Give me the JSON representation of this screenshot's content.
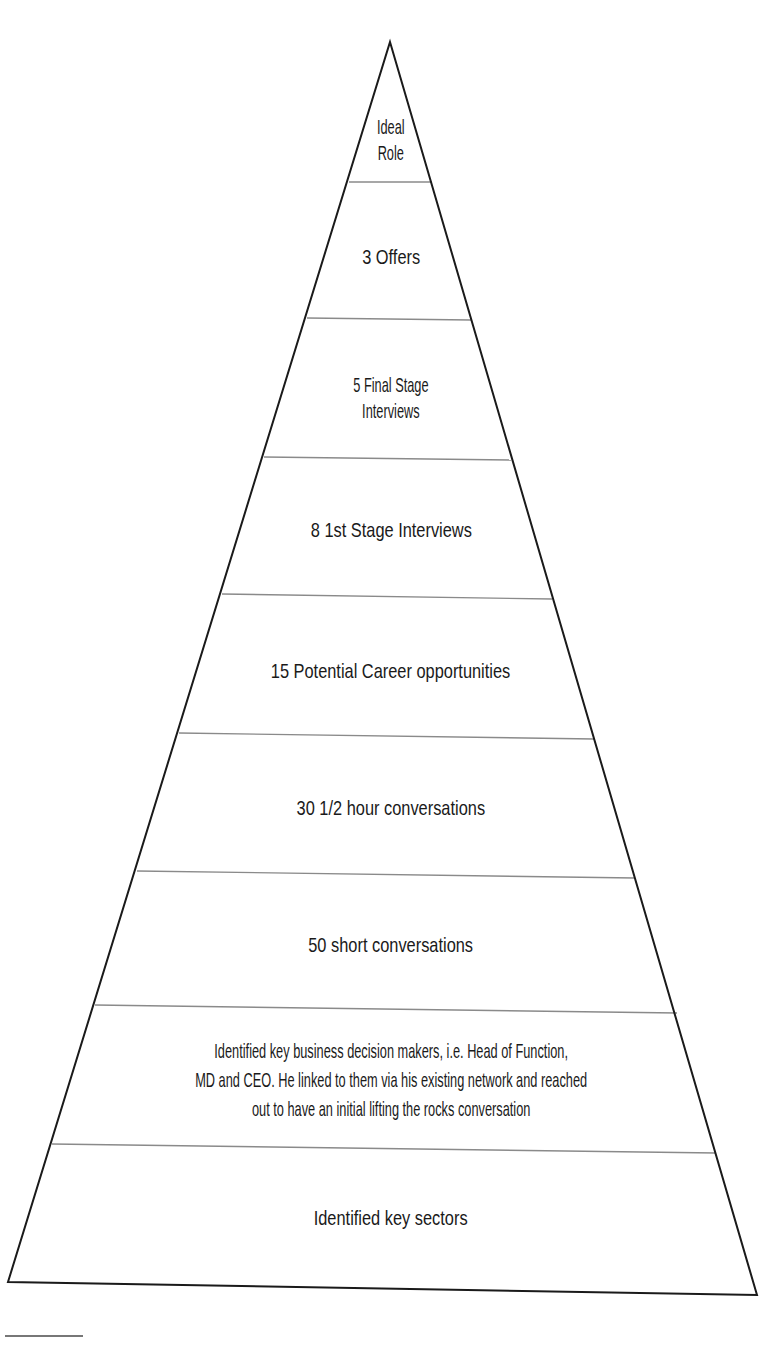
{
  "diagram": {
    "type": "pyramid",
    "colors": {
      "outline": "#1a1a1a",
      "divider": "#8a8a8a",
      "text": "#1a1a1a",
      "background": "#ffffff"
    },
    "levels": [
      {
        "lines": [
          "Ideal",
          "Role"
        ]
      },
      {
        "lines": [
          "3 Offers"
        ]
      },
      {
        "lines": [
          "5 Final Stage",
          "Interviews"
        ]
      },
      {
        "lines": [
          "8 1st Stage Interviews"
        ]
      },
      {
        "lines": [
          "15 Potential Career opportunities"
        ]
      },
      {
        "lines": [
          "30 1/2 hour conversations"
        ]
      },
      {
        "lines": [
          "50 short conversations"
        ]
      },
      {
        "lines": [
          "Identified key business decision makers, i.e. Head of Function,",
          "MD and CEO. He linked to them via his existing network and reached",
          "out to have an initial lifting the rocks conversation"
        ]
      },
      {
        "lines": [
          "Identified key sectors"
        ]
      }
    ]
  }
}
